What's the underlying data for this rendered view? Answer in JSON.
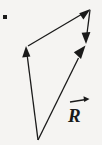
{
  "figure": {
    "kind": "vector-addition-diagram",
    "background_color": "#f5f4f2",
    "stroke_color": "#1a1a1a",
    "width": 102,
    "height": 145,
    "labels": {
      "resultant": "R",
      "resultant_accent": "vector-arrow-overbar"
    },
    "marker_dot": {
      "name": "corner-dot",
      "x": 5,
      "y": 17,
      "size": 4,
      "color": "#1a1a1a"
    },
    "vectors": [
      {
        "name": "vector-left-up",
        "from": [
          38,
          140
        ],
        "to": [
          26,
          48
        ],
        "arrowhead": "at-tip",
        "direction": "up-left"
      },
      {
        "name": "vector-diagonal-upright",
        "from": [
          28,
          46
        ],
        "to": [
          90,
          9
        ],
        "arrowhead": "at-tip",
        "direction": "up-right"
      },
      {
        "name": "vector-right-down",
        "from": [
          90,
          10
        ],
        "to": [
          86,
          43
        ],
        "arrowhead": "at-tip",
        "direction": "down"
      },
      {
        "name": "vector-resultant-R",
        "from": [
          38,
          140
        ],
        "to": [
          85,
          46
        ],
        "arrowhead": "at-tip",
        "direction": "up-right"
      }
    ]
  }
}
